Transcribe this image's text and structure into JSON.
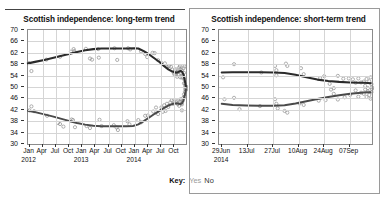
{
  "key": {
    "label": "Key:",
    "yes": "Yes",
    "no": "No",
    "yes_color": "#9a9a9a",
    "no_color": "#2b2b2b"
  },
  "panels": [
    {
      "title": "Scottish independence: long-term trend"
    },
    {
      "title": "Scottish independence: short-term trend"
    }
  ],
  "chart_data": [
    {
      "type": "scatter",
      "title": "Scottish independence: long-term trend",
      "xlabel": "",
      "ylabel": "",
      "ylim": [
        30,
        70
      ],
      "yticks": [
        30,
        34,
        38,
        42,
        46,
        50,
        54,
        58,
        62,
        66,
        70
      ],
      "grid": true,
      "legend_position": "below",
      "xtick_labels": [
        "Jan",
        "Apr",
        "Jul",
        "Oct",
        "Jan",
        "Apr",
        "Jul",
        "Oct",
        "Jan",
        "Apr",
        "Jul",
        "Oct"
      ],
      "xtick_years": [
        "2012",
        "",
        "",
        "",
        "2013",
        "",
        "",
        "",
        "2014",
        "",
        "",
        ""
      ],
      "xlim": [
        0,
        11.6
      ],
      "series": [
        {
          "name": "No",
          "color": "#2b2b2b",
          "trend": [
            [
              0.0,
              58.3
            ],
            [
              0.6,
              58.9
            ],
            [
              1.2,
              59.5
            ],
            [
              1.8,
              60.2
            ],
            [
              2.4,
              60.9
            ],
            [
              3.0,
              61.6
            ],
            [
              3.6,
              62.3
            ],
            [
              4.2,
              62.9
            ],
            [
              4.8,
              63.3
            ],
            [
              5.4,
              63.5
            ],
            [
              6.0,
              63.5
            ],
            [
              6.6,
              63.5
            ],
            [
              7.2,
              63.5
            ],
            [
              7.8,
              63.6
            ],
            [
              8.1,
              63.5
            ],
            [
              8.5,
              62.6
            ],
            [
              8.9,
              61.4
            ],
            [
              9.3,
              60.0
            ],
            [
              9.7,
              58.6
            ],
            [
              10.0,
              57.3
            ],
            [
              10.3,
              56.2
            ],
            [
              10.6,
              55.4
            ],
            [
              10.9,
              55.0
            ],
            [
              11.05,
              55.3
            ],
            [
              11.2,
              55.6
            ],
            [
              11.32,
              55.3
            ],
            [
              11.42,
              54.3
            ],
            [
              11.5,
              52.6
            ],
            [
              11.56,
              51.0
            ],
            [
              11.6,
              50.3
            ]
          ],
          "points": [
            [
              0.05,
              58.4
            ],
            [
              0.25,
              55.6
            ],
            [
              1.35,
              59.6
            ],
            [
              2.35,
              60.6
            ],
            [
              3.15,
              62.4
            ],
            [
              3.35,
              63.3
            ],
            [
              3.4,
              62.6
            ],
            [
              4.25,
              63.4
            ],
            [
              4.55,
              60.0
            ],
            [
              4.7,
              59.6
            ],
            [
              5.15,
              63.3
            ],
            [
              5.2,
              60.3
            ],
            [
              6.35,
              63.6
            ],
            [
              6.55,
              59.5
            ],
            [
              7.35,
              63.6
            ],
            [
              7.5,
              63.2
            ],
            [
              8.3,
              62.5
            ],
            [
              8.6,
              61.6
            ],
            [
              8.75,
              60.5
            ],
            [
              9.15,
              62.0
            ],
            [
              9.3,
              61.9
            ],
            [
              9.55,
              59.4
            ],
            [
              9.8,
              58.4
            ],
            [
              10.05,
              58.3
            ],
            [
              10.2,
              57.1
            ],
            [
              10.35,
              57.3
            ],
            [
              10.5,
              57.1
            ],
            [
              10.6,
              56.1
            ],
            [
              10.7,
              55.0
            ],
            [
              10.75,
              54.4
            ],
            [
              10.85,
              56.2
            ],
            [
              10.9,
              54.9
            ],
            [
              11.0,
              55.3
            ],
            [
              11.05,
              54.2
            ],
            [
              11.1,
              56.8
            ],
            [
              11.15,
              57.3
            ],
            [
              11.2,
              56.2
            ],
            [
              11.25,
              54.9
            ],
            [
              11.3,
              55.8
            ],
            [
              11.35,
              54.2
            ],
            [
              11.4,
              53.3
            ],
            [
              11.45,
              55.0
            ],
            [
              11.5,
              52.5
            ],
            [
              11.52,
              51.2
            ],
            [
              11.55,
              50.4
            ],
            [
              11.58,
              49.6
            ],
            [
              11.6,
              50.2
            ],
            [
              11.45,
              51.3
            ],
            [
              11.3,
              53.3
            ],
            [
              11.18,
              53.4
            ],
            [
              10.95,
              53.6
            ],
            [
              10.8,
              55.8
            ],
            [
              11.42,
              56.6
            ],
            [
              11.48,
              57.2
            ]
          ]
        },
        {
          "name": "Yes",
          "color": "#4a4a4a",
          "trend": [
            [
              0.0,
              41.7
            ],
            [
              0.6,
              41.1
            ],
            [
              1.2,
              40.4
            ],
            [
              1.8,
              39.7
            ],
            [
              2.4,
              38.9
            ],
            [
              3.0,
              38.1
            ],
            [
              3.6,
              37.4
            ],
            [
              4.2,
              36.8
            ],
            [
              4.8,
              36.4
            ],
            [
              5.4,
              36.2
            ],
            [
              6.0,
              36.2
            ],
            [
              6.6,
              36.2
            ],
            [
              7.2,
              36.2
            ],
            [
              7.7,
              36.3
            ],
            [
              8.1,
              36.9
            ],
            [
              8.5,
              38.0
            ],
            [
              8.9,
              39.3
            ],
            [
              9.3,
              40.6
            ],
            [
              9.7,
              41.8
            ],
            [
              10.0,
              42.7
            ],
            [
              10.3,
              43.5
            ],
            [
              10.6,
              44.0
            ],
            [
              10.9,
              44.3
            ],
            [
              11.05,
              44.1
            ],
            [
              11.2,
              44.0
            ],
            [
              11.32,
              44.4
            ],
            [
              11.42,
              45.4
            ],
            [
              11.5,
              46.9
            ],
            [
              11.56,
              48.3
            ],
            [
              11.6,
              49.1
            ]
          ],
          "points": [
            [
              0.1,
              41.8
            ],
            [
              0.25,
              43.2
            ],
            [
              0.45,
              41.5
            ],
            [
              1.4,
              39.9
            ],
            [
              2.2,
              37.4
            ],
            [
              2.35,
              37.0
            ],
            [
              2.6,
              36.1
            ],
            [
              3.2,
              38.6
            ],
            [
              3.3,
              38.4
            ],
            [
              3.45,
              35.9
            ],
            [
              4.3,
              36.3
            ],
            [
              4.55,
              35.6
            ],
            [
              5.25,
              38.5
            ],
            [
              5.4,
              36.3
            ],
            [
              6.3,
              36.6
            ],
            [
              6.5,
              35.8
            ],
            [
              6.6,
              34.9
            ],
            [
              7.3,
              38.0
            ],
            [
              7.45,
              36.9
            ],
            [
              8.1,
              38.4
            ],
            [
              8.3,
              37.6
            ],
            [
              8.6,
              39.9
            ],
            [
              8.8,
              40.0
            ],
            [
              9.2,
              41.4
            ],
            [
              9.4,
              42.8
            ],
            [
              9.55,
              40.5
            ],
            [
              9.8,
              42.9
            ],
            [
              10.0,
              43.6
            ],
            [
              10.2,
              44.1
            ],
            [
              10.3,
              43.0
            ],
            [
              10.45,
              44.6
            ],
            [
              10.55,
              45.3
            ],
            [
              10.65,
              44.1
            ],
            [
              10.75,
              45.5
            ],
            [
              10.9,
              44.5
            ],
            [
              11.0,
              44.0
            ],
            [
              11.05,
              45.4
            ],
            [
              11.1,
              43.4
            ],
            [
              11.15,
              44.9
            ],
            [
              11.2,
              45.7
            ],
            [
              11.25,
              44.2
            ],
            [
              11.3,
              43.9
            ],
            [
              11.35,
              45.1
            ],
            [
              11.4,
              46.2
            ],
            [
              11.45,
              47.4
            ],
            [
              11.5,
              46.6
            ],
            [
              11.52,
              48.3
            ],
            [
              11.55,
              49.2
            ],
            [
              11.58,
              50.0
            ],
            [
              11.6,
              49.0
            ],
            [
              11.3,
              41.8
            ],
            [
              10.1,
              41.6
            ],
            [
              9.9,
              41.3
            ]
          ]
        }
      ]
    },
    {
      "type": "scatter",
      "title": "Scottish independence: short-term trend",
      "xlabel": "",
      "ylabel": "",
      "ylim": [
        30,
        70
      ],
      "yticks": [
        30,
        34,
        38,
        42,
        46,
        50,
        54,
        58,
        62,
        66,
        70
      ],
      "grid": true,
      "legend_position": "below",
      "xtick_labels": [
        "29Jun",
        "13Jul",
        "27Jul",
        "10Aug",
        "24Aug",
        "07Sep"
      ],
      "xtick_years": [
        "2014",
        "",
        "",
        "",
        "",
        ""
      ],
      "xlim": [
        0,
        5.6
      ],
      "series": [
        {
          "name": "No",
          "color": "#2b2b2b",
          "trend": [
            [
              0.1,
              55.1
            ],
            [
              0.5,
              55.2
            ],
            [
              1.0,
              55.2
            ],
            [
              1.5,
              55.2
            ],
            [
              2.0,
              55.1
            ],
            [
              2.4,
              54.9
            ],
            [
              2.8,
              54.3
            ],
            [
              3.2,
              53.4
            ],
            [
              3.6,
              52.6
            ],
            [
              4.0,
              52.1
            ],
            [
              4.4,
              51.8
            ],
            [
              4.8,
              51.6
            ],
            [
              5.1,
              51.5
            ],
            [
              5.3,
              51.5
            ],
            [
              5.45,
              51.4
            ],
            [
              5.55,
              51.3
            ]
          ],
          "points": [
            [
              0.15,
              53.4
            ],
            [
              0.55,
              58.0
            ],
            [
              1.55,
              55.1
            ],
            [
              2.05,
              57.4
            ],
            [
              2.1,
              55.9
            ],
            [
              2.1,
              54.1
            ],
            [
              2.45,
              58.2
            ],
            [
              2.5,
              57.4
            ],
            [
              3.0,
              56.6
            ],
            [
              3.1,
              54.5
            ],
            [
              3.7,
              53.1
            ],
            [
              3.85,
              53.8
            ],
            [
              4.05,
              51.1
            ],
            [
              4.2,
              49.6
            ],
            [
              4.35,
              53.9
            ],
            [
              4.55,
              52.9
            ],
            [
              4.75,
              53.0
            ],
            [
              4.9,
              52.7
            ],
            [
              5.0,
              51.5
            ],
            [
              5.1,
              53.0
            ],
            [
              5.2,
              51.6
            ],
            [
              5.3,
              51.9
            ],
            [
              5.35,
              50.4
            ],
            [
              5.4,
              52.8
            ],
            [
              5.45,
              49.6
            ],
            [
              5.5,
              52.0
            ],
            [
              5.55,
              53.4
            ],
            [
              5.58,
              51.0
            ],
            [
              5.6,
              49.9
            ]
          ]
        },
        {
          "name": "Yes",
          "color": "#4a4a4a",
          "trend": [
            [
              0.1,
              44.1
            ],
            [
              0.5,
              43.7
            ],
            [
              1.0,
              43.5
            ],
            [
              1.5,
              43.4
            ],
            [
              2.0,
              43.4
            ],
            [
              2.4,
              43.6
            ],
            [
              2.8,
              44.2
            ],
            [
              3.2,
              45.0
            ],
            [
              3.6,
              45.8
            ],
            [
              4.0,
              46.5
            ],
            [
              4.4,
              47.1
            ],
            [
              4.8,
              47.6
            ],
            [
              5.1,
              47.9
            ],
            [
              5.3,
              48.1
            ],
            [
              5.45,
              48.2
            ],
            [
              5.55,
              48.2
            ]
          ],
          "points": [
            [
              0.2,
              45.7
            ],
            [
              0.55,
              46.2
            ],
            [
              0.75,
              42.2
            ],
            [
              1.5,
              43.3
            ],
            [
              2.05,
              45.7
            ],
            [
              2.1,
              44.1
            ],
            [
              2.15,
              42.5
            ],
            [
              2.4,
              41.6
            ],
            [
              2.5,
              41.0
            ],
            [
              2.95,
              44.2
            ],
            [
              3.1,
              43.7
            ],
            [
              3.65,
              45.2
            ],
            [
              3.9,
              45.4
            ],
            [
              4.1,
              49.1
            ],
            [
              4.2,
              47.6
            ],
            [
              4.35,
              45.6
            ],
            [
              4.6,
              46.4
            ],
            [
              4.8,
              47.2
            ],
            [
              5.0,
              48.8
            ],
            [
              5.1,
              46.6
            ],
            [
              5.2,
              48.0
            ],
            [
              5.3,
              47.6
            ],
            [
              5.35,
              49.1
            ],
            [
              5.4,
              46.5
            ],
            [
              5.45,
              48.4
            ],
            [
              5.5,
              47.2
            ],
            [
              5.55,
              45.9
            ],
            [
              5.58,
              48.2
            ],
            [
              5.6,
              49.3
            ]
          ]
        }
      ]
    }
  ]
}
